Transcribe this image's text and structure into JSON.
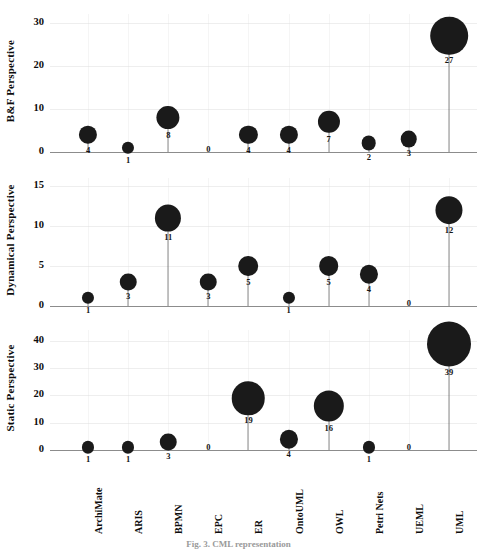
{
  "figure": {
    "caption": "Fig. 3.  CML representation",
    "background_color": "#ffffff",
    "bubble_color": "#1a1a1a",
    "grid_color": "#cfcfcf",
    "axis_color": "#8c8c8c"
  },
  "categories": [
    "ArchiMate",
    "ARIS",
    "BPMN",
    "EPC",
    "ER",
    "OntoUML",
    "OWL",
    "Petri Nets",
    "UEML",
    "UML"
  ],
  "chart_data": [
    {
      "type": "scatter",
      "title": "B&F Perspective",
      "ylabel": "B&F Perspective",
      "xlabel": "",
      "categories": [
        "ArchiMate",
        "ARIS",
        "BPMN",
        "EPC",
        "ER",
        "OntoUML",
        "OWL",
        "Petri Nets",
        "UEML",
        "UML"
      ],
      "values": [
        4,
        1,
        8,
        0,
        4,
        4,
        7,
        2,
        3,
        27
      ],
      "yticks": [
        0,
        10,
        20,
        30
      ],
      "ylim": [
        0,
        32
      ],
      "grid": true,
      "legend": "none"
    },
    {
      "type": "scatter",
      "title": "Dynamical Perspective",
      "ylabel": "Dynamical Perspective",
      "xlabel": "",
      "categories": [
        "ArchiMate",
        "ARIS",
        "BPMN",
        "EPC",
        "ER",
        "OntoUML",
        "OWL",
        "Petri Nets",
        "UEML",
        "UML"
      ],
      "values": [
        1,
        3,
        11,
        3,
        5,
        1,
        5,
        4,
        0,
        12
      ],
      "yticks": [
        0,
        5,
        10,
        15
      ],
      "ylim": [
        0,
        16
      ],
      "grid": true,
      "legend": "none"
    },
    {
      "type": "scatter",
      "title": "Static Perspective",
      "ylabel": "Static Perspective",
      "xlabel": "",
      "categories": [
        "ArchiMate",
        "ARIS",
        "BPMN",
        "EPC",
        "ER",
        "OntoUML",
        "OWL",
        "Petri Nets",
        "UEML",
        "UML"
      ],
      "values": [
        1,
        1,
        3,
        0,
        19,
        4,
        16,
        1,
        0,
        39
      ],
      "yticks": [
        0,
        10,
        20,
        30,
        40
      ],
      "ylim": [
        0,
        44
      ],
      "grid": true,
      "legend": "none"
    }
  ]
}
